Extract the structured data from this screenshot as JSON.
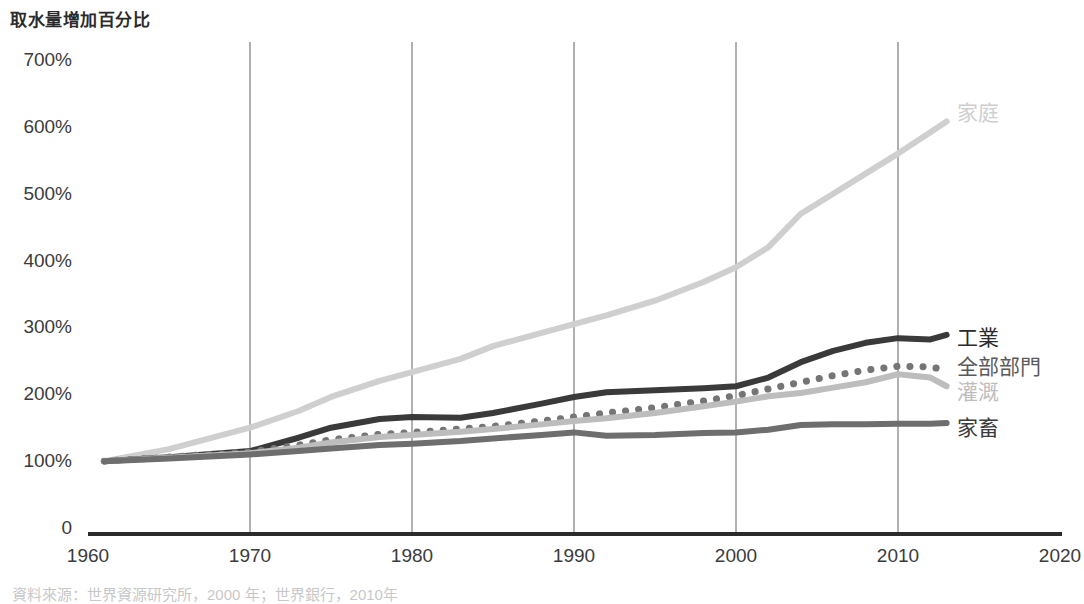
{
  "chart_data": {
    "type": "line",
    "title": "取水量增加百分比",
    "xlabel": "",
    "ylabel": "取水量增加百分比",
    "xlim": [
      1960,
      2020
    ],
    "ylim": [
      0,
      700
    ],
    "grid": "vertical-only",
    "legend_position": "right-of-line-ends",
    "x_ticks": [
      "1960",
      "1970",
      "1980",
      "1990",
      "2000",
      "2010",
      "2020"
    ],
    "y_ticks": [
      "0",
      "100%",
      "200%",
      "300%",
      "400%",
      "500%",
      "600%",
      "700%"
    ],
    "source_note": "資料來源：世界資源研究所，2000 年；世界銀行，2010年",
    "x": [
      1961,
      1965,
      1970,
      1973,
      1975,
      1978,
      1980,
      1983,
      1985,
      1988,
      1990,
      1992,
      1995,
      1998,
      2000,
      2002,
      2004,
      2006,
      2008,
      2010,
      2012,
      2013
    ],
    "series": [
      {
        "name": "家庭",
        "label": "家庭",
        "color": "#cfcfcf",
        "style": "solid",
        "width": 6,
        "label_x": 957,
        "label_y": 111,
        "values": [
          100,
          118,
          150,
          175,
          196,
          220,
          233,
          253,
          272,
          292,
          305,
          318,
          340,
          368,
          390,
          420,
          470,
          500,
          530,
          560,
          592,
          608
        ]
      },
      {
        "name": "工業",
        "label": "工業",
        "color": "#3a3a3a",
        "style": "solid",
        "width": 6,
        "label_x": 957,
        "label_y": 336,
        "values": [
          100,
          106,
          115,
          135,
          150,
          163,
          166,
          165,
          172,
          186,
          196,
          203,
          206,
          209,
          212,
          225,
          248,
          265,
          277,
          284,
          282,
          289
        ]
      },
      {
        "name": "全部部門",
        "label": "全部部門",
        "color": "#757575",
        "style": "dotted",
        "width": 7,
        "label_x": 957,
        "label_y": 365,
        "values": [
          100,
          106,
          114,
          124,
          132,
          140,
          143,
          148,
          152,
          160,
          166,
          172,
          180,
          190,
          198,
          208,
          218,
          228,
          236,
          242,
          241,
          236
        ]
      },
      {
        "name": "灌溉",
        "label": "灌溉",
        "color": "#bdbdbd",
        "style": "solid",
        "width": 6,
        "label_x": 957,
        "label_y": 390,
        "values": [
          100,
          105,
          112,
          120,
          128,
          136,
          139,
          144,
          148,
          155,
          160,
          164,
          172,
          182,
          189,
          197,
          202,
          210,
          218,
          230,
          225,
          212
        ]
      },
      {
        "name": "家畜",
        "label": "家畜",
        "color": "#6e6e6e",
        "style": "solid",
        "width": 6,
        "label_x": 957,
        "label_y": 426,
        "values": [
          100,
          104,
          110,
          115,
          119,
          124,
          126,
          130,
          134,
          139,
          143,
          138,
          139,
          142,
          143,
          147,
          154,
          155,
          155,
          156,
          156,
          157
        ]
      }
    ]
  },
  "axes": {
    "y_title": "取水量增加百分比",
    "y_ticks": [
      {
        "label": "700%",
        "value": 700
      },
      {
        "label": "600%",
        "value": 600
      },
      {
        "label": "500%",
        "value": 500
      },
      {
        "label": "400%",
        "value": 400
      },
      {
        "label": "300%",
        "value": 300
      },
      {
        "label": "200%",
        "value": 200
      },
      {
        "label": "100%",
        "value": 100
      },
      {
        "label": "0",
        "value": 0
      }
    ],
    "x_ticks": [
      {
        "label": "1960",
        "value": 1960
      },
      {
        "label": "1970",
        "value": 1970
      },
      {
        "label": "1980",
        "value": 1980
      },
      {
        "label": "1990",
        "value": 1990
      },
      {
        "label": "2000",
        "value": 2000
      },
      {
        "label": "2010",
        "value": 2010
      },
      {
        "label": "2020",
        "value": 2020
      }
    ]
  },
  "footer": {
    "source": "資料來源：世界資源研究所，2000 年；世界銀行，2010年"
  },
  "colors": {
    "domestic": "#cfcfcf",
    "industry": "#3a3a3a",
    "all_sectors": "#757575",
    "irrigation": "#bdbdbd",
    "livestock": "#6e6e6e",
    "axis": "#2b2b2b",
    "gridline": "#9d9d9d",
    "text": "#3b3b3b"
  }
}
